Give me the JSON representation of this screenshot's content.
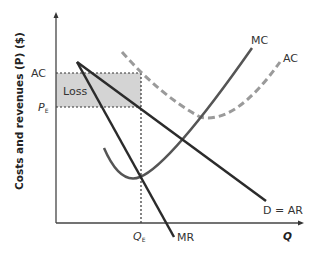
{
  "diagram": {
    "type": "economics-monopoly-loss",
    "y_axis_label": "Costs and revenues (P) ($)",
    "x_axis_label": "Q",
    "labels": {
      "mc": "MC",
      "ac_curve": "AC",
      "ac_level": "AC",
      "pe": "P",
      "pe_sub": "E",
      "qe": "Q",
      "qe_sub": "E",
      "demand": "D = AR",
      "mr": "MR",
      "loss": "Loss"
    },
    "colors": {
      "loss_fill": "#d4d4d4",
      "demand_mr": "#2b2b2b",
      "mc": "#555555",
      "ac": "#9a9a9a",
      "axis": "#333333"
    }
  }
}
